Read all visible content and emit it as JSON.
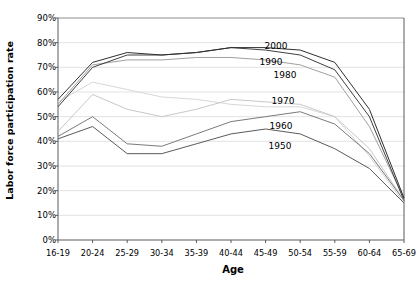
{
  "chart_data": {
    "type": "line",
    "title": "",
    "xlabel": "Age",
    "ylabel": "Labor force participation rate",
    "categories": [
      "16-19",
      "20-24",
      "25-29",
      "30-34",
      "35-39",
      "40-44",
      "45-49",
      "50-54",
      "55-59",
      "60-64",
      "65-69"
    ],
    "ylim": [
      0,
      90
    ],
    "ytick_labels": [
      "0%",
      "10%",
      "20%",
      "30%",
      "40%",
      "50%",
      "60%",
      "70%",
      "80%",
      "90%"
    ],
    "ytick_values": [
      0,
      10,
      20,
      30,
      40,
      50,
      60,
      70,
      80,
      90
    ],
    "grid": true,
    "legend_position": "inline-right",
    "series": [
      {
        "name": "1950",
        "color": "#5a5a5a",
        "values": [
          41,
          46,
          35,
          35,
          39,
          43,
          45,
          43,
          37,
          29,
          15
        ]
      },
      {
        "name": "1960",
        "color": "#7a7a7a",
        "values": [
          42,
          50,
          39,
          38,
          43,
          48,
          50,
          52,
          47,
          35,
          16
        ]
      },
      {
        "name": "1970",
        "color": "#c8c8c8",
        "values": [
          44,
          59,
          53,
          50,
          53,
          57,
          56,
          55,
          50,
          37,
          16
        ]
      },
      {
        "name": "1980",
        "color": "#d8d8d8",
        "values": [
          56,
          64,
          61,
          58,
          57,
          55,
          54,
          54,
          50,
          34,
          15
        ]
      },
      {
        "name": "1990",
        "color": "#a0a0a0",
        "values": [
          55,
          71,
          73,
          73,
          74,
          74,
          73,
          71,
          66,
          46,
          17
        ]
      },
      {
        "name": "2000",
        "color": "#404040",
        "values": [
          54,
          70,
          75,
          75,
          76,
          78,
          77,
          75,
          69,
          50,
          16
        ]
      },
      {
        "name": "2000b",
        "color": "#2f2f2f",
        "values": [
          57,
          72,
          76,
          75,
          76,
          78,
          78,
          77,
          72,
          53,
          17
        ]
      }
    ],
    "series_labels": [
      {
        "text": "2000",
        "x": 276,
        "y": 46
      },
      {
        "text": "1990",
        "x": 271,
        "y": 62
      },
      {
        "text": "1980",
        "x": 285,
        "y": 75
      },
      {
        "text": "1970",
        "x": 283,
        "y": 101
      },
      {
        "text": "1960",
        "x": 281,
        "y": 126
      },
      {
        "text": "1950",
        "x": 280,
        "y": 146
      }
    ]
  }
}
